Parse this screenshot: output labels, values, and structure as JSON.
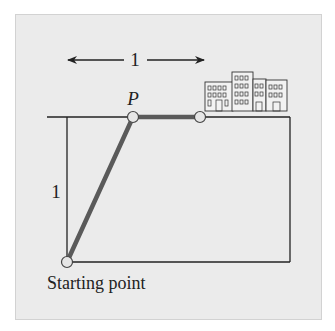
{
  "figure": {
    "horizontal_dimension_label": "1",
    "vertical_dimension_label": "1",
    "point_label": "P",
    "start_label": "Starting point",
    "icon": "city-buildings-icon"
  },
  "colors": {
    "panel_bg": "#ebebeb",
    "path": "#5a5a5a",
    "line": "#222222",
    "node_fill": "#e6e6e6"
  }
}
